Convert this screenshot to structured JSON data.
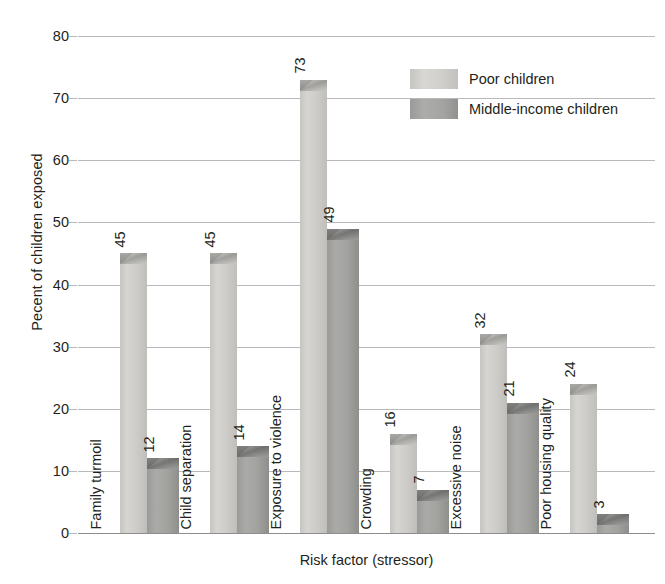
{
  "chart_data": {
    "type": "bar",
    "title": "",
    "xlabel": "Risk factor (stressor)",
    "ylabel": "Pecent of children exposed",
    "ylim": [
      0,
      80
    ],
    "yticks": [
      0,
      10,
      20,
      30,
      40,
      50,
      60,
      70,
      80
    ],
    "grid": true,
    "legend_position": "top-right",
    "categories": [
      "Family turmoil",
      "Child separation",
      "Exposure to violence",
      "Crowding",
      "Excessive noise",
      "Poor housing quality"
    ],
    "series": [
      {
        "name": "Poor children",
        "color": "#cfcecb",
        "values": [
          45,
          45,
          73,
          16,
          32,
          24
        ]
      },
      {
        "name": "Middle-income children",
        "color": "#a3a3a1",
        "values": [
          12,
          14,
          49,
          7,
          21,
          3
        ]
      }
    ]
  },
  "legend": {
    "items": [
      {
        "label": "Poor children",
        "swatch": "light"
      },
      {
        "label": "Middle-income children",
        "swatch": "dark"
      }
    ]
  },
  "axes": {
    "y_title": "Pecent of children exposed",
    "x_title": "Risk factor (stressor)",
    "y_tick_labels": [
      "0",
      "10",
      "20",
      "30",
      "40",
      "50",
      "60",
      "70",
      "80"
    ]
  },
  "colors": {
    "series_light": "#cfcecb",
    "series_dark": "#a3a3a1",
    "gridline": "#b9b9bb",
    "axis": "#8d8d8f",
    "text": "#231f20",
    "background": "#ffffff"
  }
}
